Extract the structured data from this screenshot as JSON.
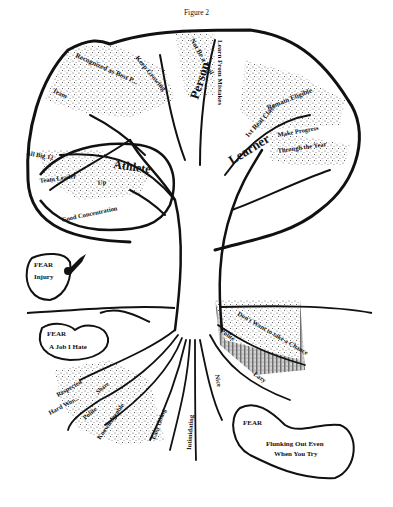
{
  "figure": {
    "caption": "Figure 2"
  },
  "canopy": {
    "branches": {
      "athlete": {
        "label": "Athlete",
        "items": [
          "All Big 12",
          "Team Leader",
          "Up",
          "Good Concentration"
        ]
      },
      "person": {
        "label": "Person",
        "items": [
          "Recognized as Best P...",
          "Keep Growing",
          "Not Be a Fool",
          "Learn From Mistakes",
          "Team",
          "A"
        ]
      },
      "learner": {
        "label": "Learner",
        "items": [
          "1st Real Class",
          "Remain Eligible",
          "Make Progress",
          "Through the Year"
        ]
      }
    }
  },
  "roots": {
    "items": [
      "Respected",
      "Hard Wor...",
      "Share",
      "Polite",
      "Knowledgeable",
      "Easy Going",
      "Intimidating",
      "Nice",
      "Lazy",
      "Polite",
      "Don't Want to take a Chance"
    ]
  },
  "fears": [
    {
      "title": "FEAR",
      "text": "Injury"
    },
    {
      "title": "FEAR",
      "text": "A Job I Hate"
    },
    {
      "title": "FEAR",
      "text": "Flunking Out Even",
      "text2": "When You Try"
    }
  ]
}
